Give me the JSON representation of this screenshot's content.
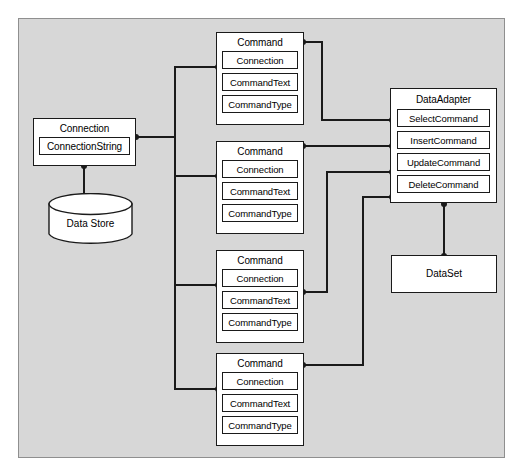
{
  "diagram": {
    "colors": {
      "panel_background": "#d7d7d7",
      "panel_border": "#8f8f8f",
      "node_fill": "#ffffff",
      "node_stroke": "#1a1a1a",
      "wire": "#1a1a1a",
      "page_background": "#ffffff"
    },
    "connection": {
      "title": "Connection",
      "members": [
        "ConnectionString"
      ]
    },
    "data_store": {
      "label": "Data Store",
      "shape": "cylinder"
    },
    "commands": [
      {
        "title": "Command",
        "members": [
          "Connection",
          "CommandText",
          "CommandType"
        ]
      },
      {
        "title": "Command",
        "members": [
          "Connection",
          "CommandText",
          "CommandType"
        ]
      },
      {
        "title": "Command",
        "members": [
          "Connection",
          "CommandText",
          "CommandType"
        ]
      },
      {
        "title": "Command",
        "members": [
          "Connection",
          "CommandText",
          "CommandType"
        ]
      }
    ],
    "data_adapter": {
      "title": "DataAdapter",
      "members": [
        "SelectCommand",
        "InsertCommand",
        "UpdateCommand",
        "DeleteCommand"
      ]
    },
    "data_set": {
      "title": "DataSet"
    }
  }
}
